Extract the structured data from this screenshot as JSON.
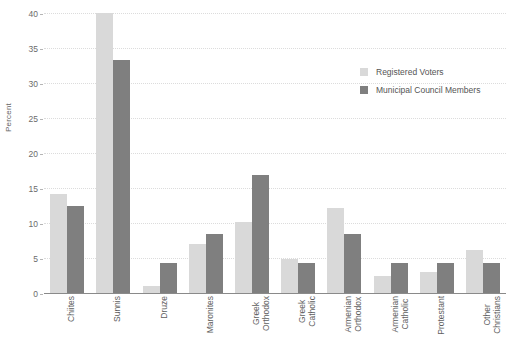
{
  "chart_data": {
    "type": "bar",
    "title": "",
    "xlabel": "",
    "ylabel": "Percent",
    "ylim": [
      0,
      40
    ],
    "ytick_labels": [
      "0",
      "5",
      "10",
      "15",
      "20",
      "25",
      "30",
      "35",
      "40"
    ],
    "yticks": [
      0,
      5,
      10,
      15,
      20,
      25,
      30,
      35,
      40
    ],
    "grid": true,
    "legend_position": "upper right",
    "categories": [
      "Chiites",
      "Sunnis",
      "Druze",
      "Maronites",
      "Greek Orthodox",
      "Greek Catholic",
      "Armenian Orthodox",
      "Armenian Catholic",
      "Protestant",
      "Other Christians"
    ],
    "category_lines": [
      [
        "Chiites"
      ],
      [
        "Sunnis"
      ],
      [
        "Druze"
      ],
      [
        "Maronites"
      ],
      [
        "Greek",
        "Orthodox"
      ],
      [
        "Greek",
        "Catholic"
      ],
      [
        "Armenian",
        "Orthodox"
      ],
      [
        "Armenian",
        "Catholic"
      ],
      [
        "Protestant"
      ],
      [
        "Other",
        "Christians"
      ]
    ],
    "series": [
      {
        "name": "Registered Voters",
        "color": "#d9d9d9",
        "values": [
          14.2,
          40.0,
          1.0,
          7.0,
          10.1,
          4.9,
          12.2,
          2.4,
          3.0,
          6.2
        ]
      },
      {
        "name": "Municipal Council Members",
        "color": "#7f7f7f",
        "values": [
          12.5,
          33.3,
          4.3,
          8.4,
          16.8,
          4.3,
          8.4,
          4.3,
          4.3,
          4.3
        ]
      }
    ]
  },
  "legend": {
    "items": [
      {
        "label": "Registered Voters",
        "swatch": "light"
      },
      {
        "label": "Municipal Council Members",
        "swatch": "dark"
      }
    ]
  }
}
